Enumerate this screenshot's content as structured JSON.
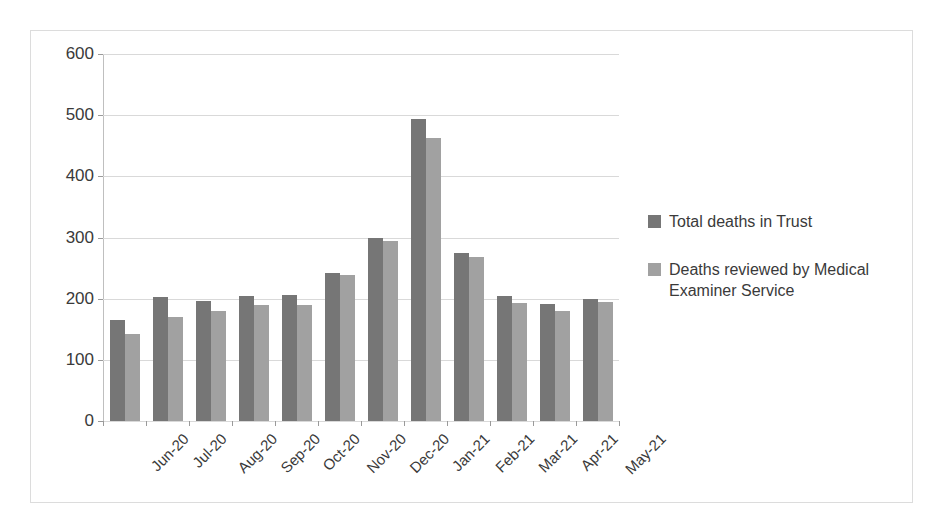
{
  "chart_data": {
    "type": "bar",
    "title": "",
    "xlabel": "",
    "ylabel": "",
    "ylim": [
      0,
      600
    ],
    "yticks": [
      0,
      100,
      200,
      300,
      400,
      500,
      600
    ],
    "grid": true,
    "legend_position": "right",
    "categories": [
      "Jun-20",
      "Jul-20",
      "Aug-20",
      "Sep-20",
      "Oct-20",
      "Nov-20",
      "Dec-20",
      "Jan-21",
      "Feb-21",
      "Mar-21",
      "Apr-21",
      "May-21"
    ],
    "series": [
      {
        "name": "Total deaths in Trust",
        "color": "#767676",
        "values": [
          165,
          202,
          196,
          205,
          206,
          242,
          300,
          493,
          275,
          204,
          191,
          200
        ]
      },
      {
        "name": "Deaths reviewed by Medical Examiner Service",
        "color": "#a1a1a1",
        "values": [
          143,
          170,
          180,
          190,
          189,
          238,
          295,
          462,
          268,
          193,
          180,
          194
        ]
      }
    ]
  },
  "axis": {
    "y_tick_labels": [
      "0",
      "100",
      "200",
      "300",
      "400",
      "500",
      "600"
    ]
  },
  "legend": {
    "entries": [
      {
        "label": "Total deaths in Trust",
        "color": "#767676"
      },
      {
        "label": "Deaths reviewed by Medical Examiner Service",
        "color": "#a1a1a1"
      }
    ]
  }
}
